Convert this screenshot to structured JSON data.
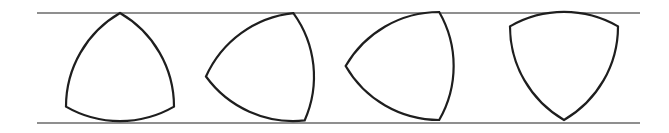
{
  "figure": {
    "colors": {
      "background": "#ffffff",
      "outline": "#1e1e1e",
      "rails": "#6a6a6a"
    },
    "rails": {
      "top": {
        "x1": 37,
        "x2": 640,
        "y": 13
      },
      "bottom": {
        "x1": 37,
        "x2": 640,
        "y": 123
      }
    },
    "width_of_curve": 108,
    "shapes": [
      {
        "label": "position-1",
        "cx": 120,
        "cy": 75.4,
        "vertex_angles_deg": [
          270,
          30,
          150
        ]
      },
      {
        "label": "position-2",
        "cx": 268,
        "cy": 70,
        "vertex_angles_deg": [
          174,
          294,
          54
        ]
      },
      {
        "label": "position-3",
        "cx": 408,
        "cy": 66,
        "vertex_angles_deg": [
          180,
          300,
          60
        ]
      },
      {
        "label": "position-4",
        "cx": 564,
        "cy": 57.6,
        "vertex_angles_deg": [
          90,
          210,
          330
        ]
      }
    ]
  }
}
